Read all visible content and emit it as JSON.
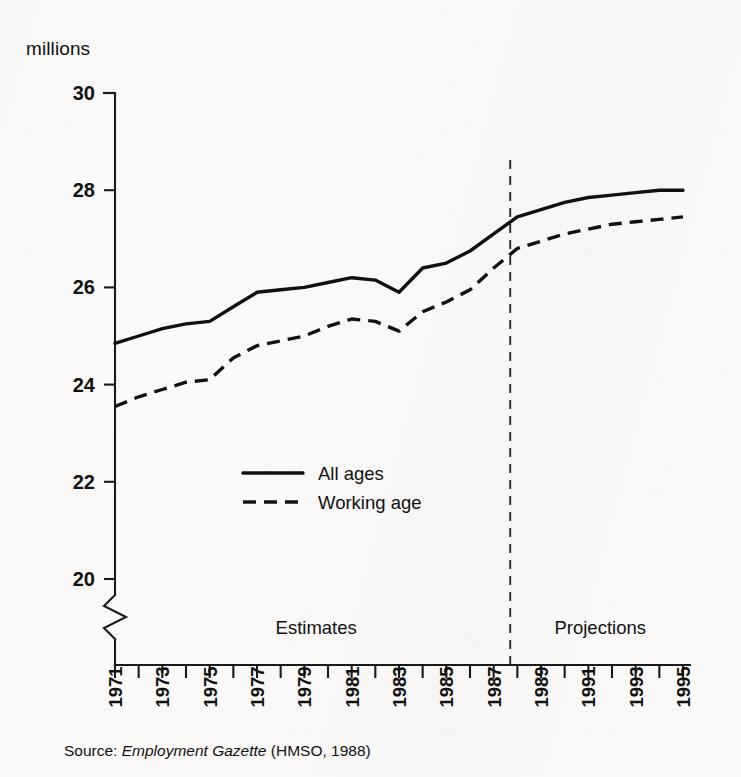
{
  "figure": {
    "unit_label": "millions",
    "source_prefix": "Source:",
    "source_title": "Employment Gazette",
    "source_suffix": "(HMSO, 1988)"
  },
  "regions": {
    "estimates_label": "Estimates",
    "projections_label": "Projections",
    "divider_year": 1987.7
  },
  "chart_data": {
    "type": "line",
    "title": "",
    "subtitle": "",
    "xlabel": "",
    "ylabel": "millions",
    "xlim": [
      1971,
      1995
    ],
    "ylim": [
      19.2,
      30
    ],
    "ylim_visible": [
      20,
      30
    ],
    "axis_break": true,
    "grid": false,
    "legend_position": "inside-center-left",
    "yticks": [
      20,
      22,
      24,
      26,
      28,
      30
    ],
    "ytick_labels": [
      "20",
      "22",
      "24",
      "26",
      "28",
      "30"
    ],
    "x": [
      1971,
      1972,
      1973,
      1974,
      1975,
      1976,
      1977,
      1978,
      1979,
      1980,
      1981,
      1982,
      1983,
      1984,
      1985,
      1986,
      1987,
      1988,
      1989,
      1990,
      1991,
      1992,
      1993,
      1994,
      1995
    ],
    "xticks": [
      1971,
      1972,
      1973,
      1974,
      1975,
      1976,
      1977,
      1978,
      1979,
      1980,
      1981,
      1982,
      1983,
      1984,
      1985,
      1986,
      1987,
      1988,
      1989,
      1990,
      1991,
      1992,
      1993,
      1994,
      1995
    ],
    "xtick_labels": [
      "1971",
      "",
      "1973",
      "",
      "1975",
      "",
      "1977",
      "",
      "1979",
      "",
      "1981",
      "",
      "1983",
      "",
      "1985",
      "",
      "1987",
      "",
      "1989",
      "",
      "1991",
      "",
      "1993",
      "",
      "1995"
    ],
    "series": [
      {
        "name": "All ages",
        "style": "solid",
        "color": "#111111",
        "values": [
          24.85,
          25.0,
          25.15,
          25.25,
          25.3,
          25.6,
          25.9,
          25.95,
          26.0,
          26.1,
          26.2,
          26.15,
          25.9,
          26.4,
          26.5,
          26.75,
          27.1,
          27.45,
          27.6,
          27.75,
          27.85,
          27.9,
          27.95,
          28.0,
          28.0
        ]
      },
      {
        "name": "Working age",
        "style": "dashed",
        "color": "#111111",
        "values": [
          23.55,
          23.75,
          23.9,
          24.05,
          24.1,
          24.55,
          24.8,
          24.9,
          25.0,
          25.2,
          25.35,
          25.3,
          25.1,
          25.5,
          25.7,
          25.95,
          26.4,
          26.8,
          26.95,
          27.1,
          27.2,
          27.3,
          27.35,
          27.4,
          27.45
        ]
      }
    ],
    "annotations": [
      {
        "text": "Estimates",
        "x": 1979.5,
        "kind": "region-label"
      },
      {
        "text": "Projections",
        "x": 1991.5,
        "kind": "region-label"
      },
      {
        "text": "vertical dashed divider between estimates and projections",
        "x": 1987.7,
        "kind": "divider"
      }
    ]
  },
  "legend": {
    "entries": [
      {
        "label": "All ages",
        "style": "solid"
      },
      {
        "label": "Working age",
        "style": "dashed"
      }
    ]
  }
}
